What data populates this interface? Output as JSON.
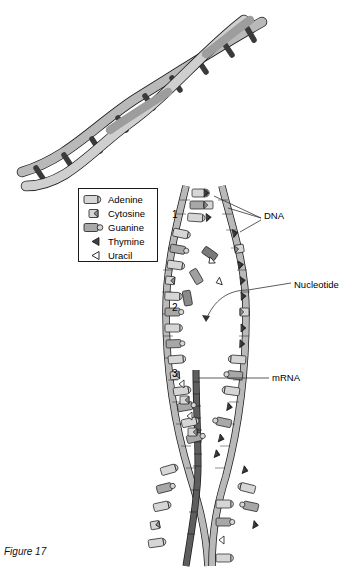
{
  "figure": {
    "caption": "Figure 17"
  },
  "legend": {
    "items": [
      {
        "label": "Adenine",
        "icon": "adenine-base-icon"
      },
      {
        "label": "Cytosine",
        "icon": "cytosine-base-icon"
      },
      {
        "label": "Guanine",
        "icon": "guanine-base-icon"
      },
      {
        "label": "Thymine",
        "icon": "thymine-base-icon"
      },
      {
        "label": "Uracil",
        "icon": "uracil-base-icon"
      }
    ]
  },
  "callouts": [
    {
      "id": "dna",
      "label": "DNA",
      "x": 264,
      "y": 216
    },
    {
      "id": "nucleotide",
      "label": "Nucleotide",
      "x": 294,
      "y": 285
    },
    {
      "id": "mrna",
      "label": "mRNA",
      "x": 272,
      "y": 378
    }
  ],
  "markers": [
    {
      "label": "1",
      "x": 172,
      "y": 215
    },
    {
      "label": "2",
      "x": 172,
      "y": 308
    },
    {
      "label": "3",
      "x": 172,
      "y": 374
    }
  ],
  "colors": {
    "backbone_light": "#b9b9b9",
    "backbone_dark": "#6f6f6f",
    "base_light": "#d6d6d6",
    "base_mid": "#a8a8a8",
    "base_dark": "#4a4a4a",
    "outline": "#1a1a1a",
    "page": "#ffffff"
  },
  "helix": {
    "description": "DNA double helix drawn diagonally across the top of the figure",
    "rungs": 12
  }
}
